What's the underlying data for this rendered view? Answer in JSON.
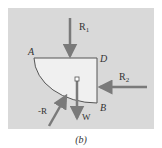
{
  "figure": {
    "caption": "(b)",
    "colors": {
      "panel": "#d9d9d9",
      "body_fill": "#f0f0f0",
      "body_stroke": "#555555",
      "arrow": "#7a7a7a",
      "text": "#333333"
    },
    "points": {
      "A": "A",
      "D": "D",
      "B": "B"
    },
    "forces": {
      "R1": "R",
      "R1_sub": "1",
      "R2": "R",
      "R2_sub": "2",
      "negR": "-R",
      "W": "W"
    }
  }
}
